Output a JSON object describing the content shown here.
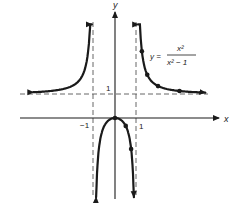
{
  "chart_data": {
    "type": "line",
    "title": "",
    "function_label": {
      "lhs": "y =",
      "numerator": "x²",
      "denominator": "x² − 1"
    },
    "xlabel": "x",
    "ylabel": "y",
    "tick_labels": {
      "x_neg1": "−1",
      "x_pos1": "1",
      "y_pos1": "1"
    },
    "asymptotes": {
      "vertical": [
        -1,
        1
      ],
      "horizontal": [
        1
      ]
    },
    "xlim": [
      -4.4,
      4.8
    ],
    "ylim": [
      -3.4,
      4.4
    ],
    "branches": [
      {
        "name": "left",
        "x_range": [
          -3.8,
          -1.08
        ]
      },
      {
        "name": "middle",
        "x_range": [
          -0.88,
          0.88
        ]
      },
      {
        "name": "right",
        "x_range": [
          1.08,
          4.2
        ]
      }
    ],
    "points": [
      {
        "x": 0,
        "y": 0
      },
      {
        "x": 0.5,
        "y": -0.33
      },
      {
        "x": 0.75,
        "y": -1.29
      },
      {
        "x": 1.25,
        "y": 2.78
      },
      {
        "x": 1.5,
        "y": 1.8
      },
      {
        "x": 2,
        "y": 1.33
      },
      {
        "x": 3,
        "y": 1.125
      }
    ],
    "grid": false,
    "legend": null
  },
  "colors": {
    "curve": "#1a1a1a",
    "axis": "#1a1a1a",
    "asymptote": "#555555"
  }
}
